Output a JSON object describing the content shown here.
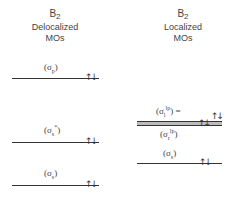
{
  "left": {
    "molecule": "B",
    "subscript": "2",
    "title_line1": "Delocalized",
    "title_line2": "MOs",
    "levels": [
      {
        "label": "σ",
        "sub": "p",
        "sup": "",
        "electrons": "↑↓"
      },
      {
        "label": "σ",
        "sub": "s",
        "sup": "*",
        "electrons": "↑↓"
      },
      {
        "label": "σ",
        "sub": "s",
        "sup": "",
        "electrons": "↑↓"
      }
    ]
  },
  "right": {
    "molecule": "B",
    "subscript": "2",
    "title_line1": "Localized",
    "title_line2": "MOs",
    "levels": [
      {
        "label": "σ",
        "sub": "l",
        "sup": "lp",
        "suffix": " =",
        "electrons": "↑↓"
      },
      {
        "label": "σ",
        "sub": "r",
        "sup": "lp",
        "suffix": "",
        "electrons": "↑↓"
      },
      {
        "label": "σ",
        "sub": "s",
        "sup": "",
        "suffix": "",
        "electrons": "↑↓"
      }
    ]
  }
}
